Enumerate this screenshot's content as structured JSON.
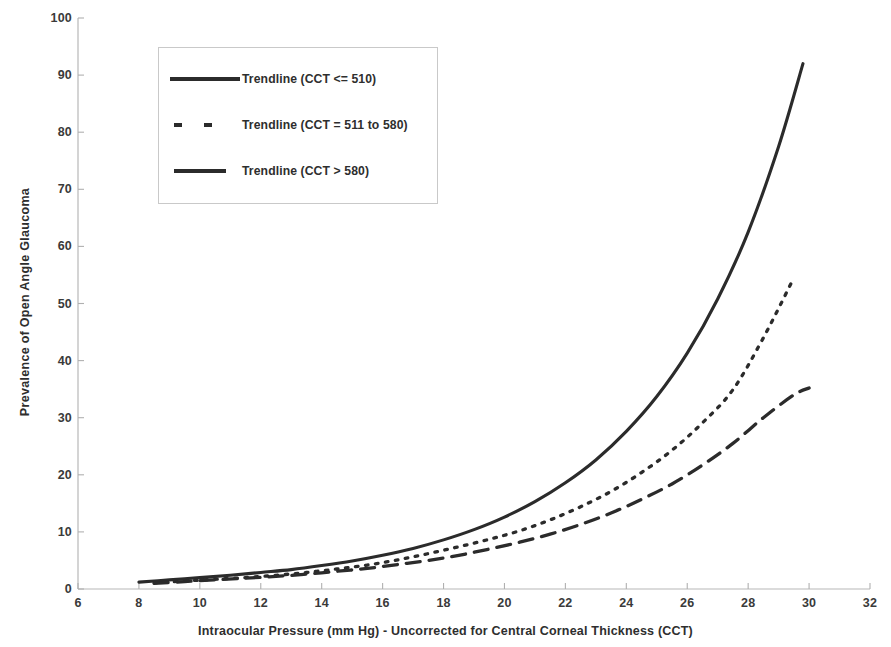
{
  "chart_data": {
    "type": "line",
    "title": "",
    "xlabel": "Intraocular Pressure (mm Hg) - Uncorrected for Central Corneal Thickness (CCT)",
    "ylabel": "Prevalence of Open Angle Glaucoma",
    "xlim": [
      6,
      32
    ],
    "ylim": [
      0,
      100
    ],
    "xticks": [
      6,
      8,
      10,
      12,
      14,
      16,
      18,
      20,
      22,
      24,
      26,
      28,
      30,
      32
    ],
    "yticks": [
      0,
      10,
      20,
      30,
      40,
      50,
      60,
      70,
      80,
      90,
      100
    ],
    "grid": false,
    "legend_position": "upper-left",
    "line_color": "#2b2b2b",
    "series": [
      {
        "name": "Trendline (CCT <= 510)",
        "style": "solid",
        "x": [
          8.0,
          9.0,
          10.0,
          11.0,
          12.0,
          13.0,
          14.0,
          15.0,
          16.0,
          17.0,
          18.0,
          19.0,
          20.0,
          21.0,
          22.0,
          23.0,
          24.0,
          25.0,
          26.0,
          27.0,
          28.0,
          29.0,
          29.8
        ],
        "values": [
          1.2,
          1.6,
          2.0,
          2.4,
          2.9,
          3.4,
          4.1,
          4.9,
          5.9,
          7.1,
          8.6,
          10.4,
          12.6,
          15.3,
          18.6,
          22.6,
          27.6,
          33.7,
          41.3,
          50.8,
          62.5,
          77.5,
          92.0
        ]
      },
      {
        "name": "Trendline (CCT = 511 to 580)",
        "style": "dotted",
        "x": [
          8.5,
          9.5,
          10.5,
          11.5,
          12.5,
          13.5,
          14.5,
          15.5,
          16.5,
          17.5,
          18.5,
          19.5,
          20.5,
          21.5,
          22.5,
          23.5,
          24.5,
          25.5,
          26.5,
          27.5,
          28.5,
          29.5
        ],
        "values": [
          1.1,
          1.4,
          1.7,
          2.0,
          2.4,
          2.9,
          3.5,
          4.2,
          5.1,
          6.2,
          7.4,
          8.7,
          10.2,
          12.1,
          14.4,
          17.1,
          20.4,
          24.3,
          29.1,
          34.9,
          44.0,
          54.5
        ]
      },
      {
        "name": "Trendline (CCT > 580)",
        "style": "dashed",
        "x": [
          8.5,
          9.5,
          10.5,
          11.5,
          12.5,
          13.5,
          14.5,
          15.5,
          16.5,
          17.5,
          18.5,
          19.5,
          20.5,
          21.5,
          22.5,
          23.5,
          24.5,
          25.5,
          26.5,
          27.5,
          28.5,
          29.5,
          30.0
        ],
        "values": [
          1.0,
          1.3,
          1.6,
          1.9,
          2.2,
          2.6,
          3.1,
          3.6,
          4.3,
          5.0,
          5.9,
          7.0,
          8.2,
          9.6,
          11.3,
          13.3,
          15.7,
          18.4,
          21.7,
          25.5,
          30.0,
          34.0,
          35.2
        ]
      }
    ]
  },
  "legend": {
    "entries": [
      {
        "label": "Trendline (CCT <= 510)",
        "style": "solid"
      },
      {
        "label": "Trendline (CCT = 511 to 580)",
        "style": "dotted"
      },
      {
        "label": "Trendline (CCT > 580)",
        "style": "dashed"
      }
    ]
  }
}
